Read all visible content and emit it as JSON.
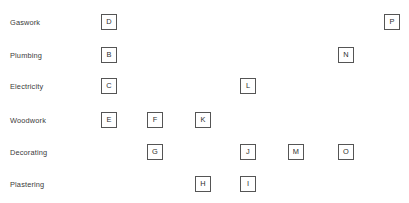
{
  "diagram": {
    "width": 409,
    "height": 203,
    "background_color": "#ffffff",
    "box_border_color": "#555555",
    "box_fill_color": "#ffffff",
    "label_color": "#3a3a3a",
    "glyph_color": "#2e2e2e",
    "rows": [
      {
        "label": "Gaswork",
        "y": 22
      },
      {
        "label": "Plumbing",
        "y": 55
      },
      {
        "label": "Electricity",
        "y": 86
      },
      {
        "label": "Woodwork",
        "y": 120
      },
      {
        "label": "Decorating",
        "y": 152
      },
      {
        "label": "Plastering",
        "y": 184
      }
    ],
    "boxes": [
      {
        "letter": "D",
        "row": "Gaswork",
        "x": 109,
        "y": 22
      },
      {
        "letter": "P",
        "row": "Gaswork",
        "x": 392,
        "y": 22
      },
      {
        "letter": "B",
        "row": "Plumbing",
        "x": 109,
        "y": 55
      },
      {
        "letter": "N",
        "row": "Plumbing",
        "x": 346,
        "y": 55
      },
      {
        "letter": "C",
        "row": "Electricity",
        "x": 109,
        "y": 86
      },
      {
        "letter": "L",
        "row": "Electricity",
        "x": 248,
        "y": 86
      },
      {
        "letter": "E",
        "row": "Woodwork",
        "x": 109,
        "y": 120
      },
      {
        "letter": "F",
        "row": "Woodwork",
        "x": 155,
        "y": 120
      },
      {
        "letter": "K",
        "row": "Woodwork",
        "x": 203,
        "y": 120
      },
      {
        "letter": "G",
        "row": "Decorating",
        "x": 155,
        "y": 152
      },
      {
        "letter": "J",
        "row": "Decorating",
        "x": 248,
        "y": 152
      },
      {
        "letter": "M",
        "row": "Decorating",
        "x": 296,
        "y": 152
      },
      {
        "letter": "O",
        "row": "Decorating",
        "x": 346,
        "y": 152
      },
      {
        "letter": "H",
        "row": "Plastering",
        "x": 203,
        "y": 184
      },
      {
        "letter": "I",
        "row": "Plastering",
        "x": 248,
        "y": 184
      }
    ]
  }
}
